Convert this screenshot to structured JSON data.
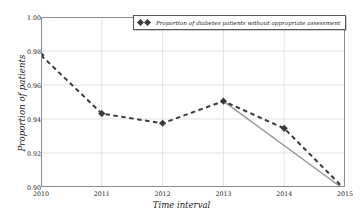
{
  "chart_data": {
    "type": "line",
    "title": "",
    "xlabel": "Time interval",
    "ylabel": "Proportion of patients",
    "x": [
      2010,
      2011,
      2012,
      2013,
      2014,
      2015
    ],
    "xticklabels": [
      "2010",
      "2011",
      "2012",
      "2013",
      "2014",
      "2015"
    ],
    "yticklabels": [
      "0.90",
      "0.92",
      "0.94",
      "0.96",
      "0.98",
      "1.00"
    ],
    "ytickvalues": [
      0.9,
      0.92,
      0.94,
      0.96,
      0.98,
      1.0
    ],
    "xlim": [
      2010,
      2015
    ],
    "ylim": [
      0.9,
      1.0
    ],
    "grid": true,
    "legend_position": "upper center",
    "series": [
      {
        "name": "Proportion of diabetes patients without appropriate assessment",
        "values": [
          0.9775,
          0.9432,
          0.9375,
          0.9505,
          0.9345,
          0.8985
        ],
        "style": "dashed",
        "marker": "diamond",
        "color": "#3b3b3b"
      },
      {
        "name": "trend-line",
        "x": [
          2013,
          2015
        ],
        "values": [
          0.9505,
          0.8982
        ],
        "style": "solid",
        "marker": "none",
        "color": "#9a9a9a"
      }
    ],
    "colors": {
      "series": "#3b3b3b",
      "trend": "#9a9a9a",
      "grid": "#e2e2e2",
      "axis": "#8c8c8c",
      "background": "#ffffff",
      "text": "#1a1a1a"
    }
  },
  "legend": {
    "label": "Proportion of diabetes patients without appropriate assessment",
    "marker_icon": "diamond-marker"
  },
  "axes": {
    "x_title": "Time interval",
    "y_title": "Proportion of patients"
  }
}
